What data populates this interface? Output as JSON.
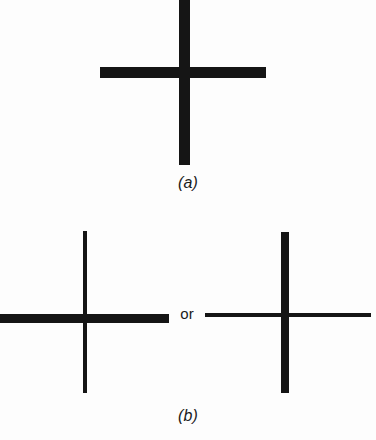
{
  "figure": {
    "background_color": "#fdfdfd",
    "ink_color": "#151515",
    "width": 376,
    "height": 440
  },
  "panels": [
    {
      "id": "a",
      "label": "(a)",
      "description": "symmetric cross with equal-weight vertical and horizontal bars",
      "shapes": [
        {
          "name": "vertical-bar",
          "weight": "thick",
          "thickness_px": 11,
          "length_px": 167
        },
        {
          "name": "horizontal-bar",
          "weight": "thick",
          "thickness_px": 11,
          "length_px": 166
        }
      ]
    },
    {
      "id": "b",
      "label": "(b)",
      "connector": "or",
      "description": "two asymmetric crosses, alternative weight assignments",
      "shapes": [
        {
          "name": "left-vertical-bar",
          "weight": "thin",
          "thickness_px": 4,
          "length_px": 162
        },
        {
          "name": "left-horizontal-bar",
          "weight": "thick",
          "thickness_px": 9,
          "length_px": 169
        },
        {
          "name": "right-vertical-bar",
          "weight": "thick",
          "thickness_px": 8,
          "length_px": 161
        },
        {
          "name": "right-horizontal-bar",
          "weight": "thin",
          "thickness_px": 4,
          "length_px": 166
        }
      ]
    }
  ]
}
